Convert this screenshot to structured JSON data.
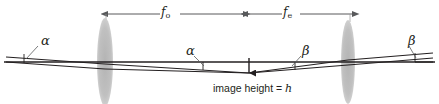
{
  "figure": {
    "background_color": "#ffffff",
    "ink_color": "#231f20",
    "lens_color": "#bcbcbc",
    "dimension_color": "#58595b"
  },
  "dimensions": [
    {
      "id": "objective-focal-length",
      "label": "f",
      "subscript": "o",
      "from_x": 108,
      "to_x": 243
    },
    {
      "id": "eyepiece-focal-length",
      "label": "f",
      "subscript": "e",
      "from_x": 248,
      "to_x": 352
    }
  ],
  "angles": [
    {
      "id": "alpha-incident",
      "symbol": "α",
      "x": 41,
      "y": 36
    },
    {
      "id": "alpha-internal",
      "symbol": "α",
      "x": 196,
      "y": 47
    },
    {
      "id": "beta-internal",
      "symbol": "β",
      "x": 303,
      "y": 47
    },
    {
      "id": "beta-exit",
      "symbol": "β",
      "x": 409,
      "y": 36
    }
  ],
  "lenses": [
    {
      "id": "objective-lens",
      "cx": 105,
      "cy": 62,
      "rx": 8,
      "ry": 44
    },
    {
      "id": "eyepiece-lens",
      "cx": 348,
      "cy": 62,
      "rx": 7,
      "ry": 42
    }
  ],
  "image_height": {
    "caption_text": "image height = ",
    "symbol": "h",
    "arrow_x": 249,
    "arrow_top": 58,
    "arrow_bottom": 73
  },
  "optical_axis": {
    "y": 62,
    "from_x": 4,
    "to_x": 435
  }
}
